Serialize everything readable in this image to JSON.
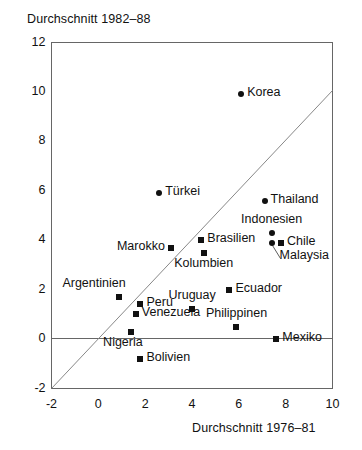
{
  "chart_data": {
    "type": "scatter",
    "title": "",
    "xlabel": "Durchschnitt 1976–81",
    "ylabel": "Durchschnitt 1982–88",
    "xlim": [
      -2,
      10
    ],
    "ylim": [
      -2,
      12
    ],
    "xticks": [
      "-2",
      "0",
      "2",
      "4",
      "6",
      "8",
      "10"
    ],
    "yticks": [
      "12",
      "10",
      "8",
      "6",
      "4",
      "2",
      "0",
      "-2"
    ],
    "xtick_values": [
      -2,
      0,
      2,
      4,
      6,
      8,
      10
    ],
    "ytick_values": [
      12,
      10,
      8,
      6,
      4,
      2,
      0,
      -2
    ],
    "grid": false,
    "legend": "none",
    "annotations": [
      {
        "name": "diagonal-reference-line",
        "description": "45-degree line y = x from (-2,-2) to (10,10)"
      },
      {
        "name": "zero-line",
        "description": "horizontal line at y = 0 spanning the plot width"
      }
    ],
    "points": [
      {
        "label": "Korea",
        "x": 6.1,
        "y": 9.9,
        "marker": "circle",
        "label_pos": "right"
      },
      {
        "label": "Türkei",
        "x": 2.6,
        "y": 5.9,
        "marker": "circle",
        "label_pos": "right"
      },
      {
        "label": "Thailand",
        "x": 7.1,
        "y": 5.6,
        "marker": "circle",
        "label_pos": "right"
      },
      {
        "label": "Indonesien",
        "x": 7.4,
        "y": 4.3,
        "marker": "circle",
        "label_pos": "above"
      },
      {
        "label": "Malaysia",
        "x": 7.4,
        "y": 3.9,
        "marker": "circle",
        "label_pos": "below-right"
      },
      {
        "label": "Chile",
        "x": 7.8,
        "y": 3.9,
        "marker": "square",
        "label_pos": "right"
      },
      {
        "label": "Brasilien",
        "x": 4.4,
        "y": 4.0,
        "marker": "square",
        "label_pos": "right"
      },
      {
        "label": "Kolumbien",
        "x": 4.5,
        "y": 3.5,
        "marker": "square",
        "label_pos": "below"
      },
      {
        "label": "Marokko",
        "x": 3.1,
        "y": 3.7,
        "marker": "square",
        "label_pos": "left"
      },
      {
        "label": "Argentinien",
        "x": 0.9,
        "y": 1.7,
        "marker": "square",
        "label_pos": "above-left"
      },
      {
        "label": "Peru",
        "x": 1.8,
        "y": 1.4,
        "marker": "square",
        "label_pos": "right"
      },
      {
        "label": "Venezuela",
        "x": 1.6,
        "y": 1.0,
        "marker": "square",
        "label_pos": "right"
      },
      {
        "label": "Uruguay",
        "x": 4.0,
        "y": 1.2,
        "marker": "square",
        "label_pos": "above"
      },
      {
        "label": "Ecuador",
        "x": 5.6,
        "y": 2.0,
        "marker": "square",
        "label_pos": "right"
      },
      {
        "label": "Philippinen",
        "x": 5.9,
        "y": 0.5,
        "marker": "square",
        "label_pos": "above"
      },
      {
        "label": "Mexiko",
        "x": 7.6,
        "y": 0.0,
        "marker": "square",
        "label_pos": "right"
      },
      {
        "label": "Nigeria",
        "x": 1.4,
        "y": 0.3,
        "marker": "square",
        "label_pos": "below-left"
      },
      {
        "label": "Bolivien",
        "x": 1.8,
        "y": -0.8,
        "marker": "square",
        "label_pos": "right"
      }
    ]
  },
  "colors": {
    "marker": "#111111",
    "axis": "#555555",
    "text": "#111111",
    "background": "#ffffff"
  }
}
